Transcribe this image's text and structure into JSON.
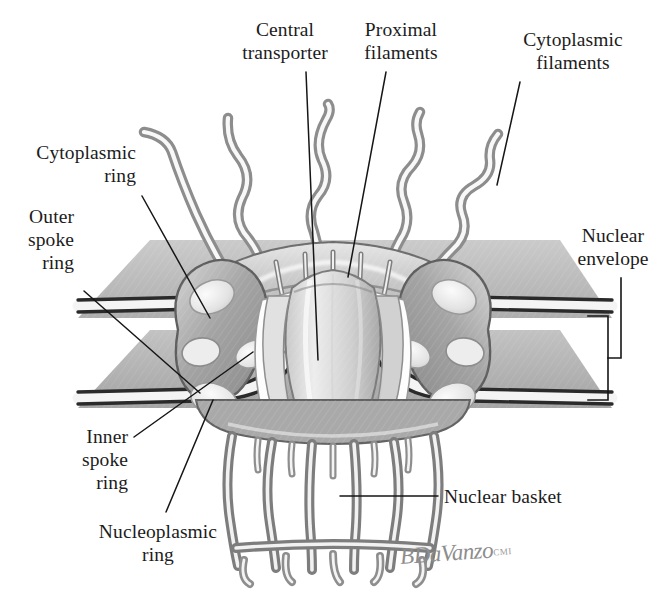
{
  "figure": {
    "kind": "scientific-illustration",
    "signature": {
      "name": "BDaVanzo",
      "credential": "CMI"
    },
    "palette": {
      "background": "#ffffff",
      "ink": "#1c1c1c",
      "membrane_dark": "#2b2b2b",
      "membrane_light": "#f2f2f2",
      "sheet_gray": "#b9b9b9",
      "sheet_gray_dark": "#9e9e9e",
      "protein_mid": "#a8a8a8",
      "protein_light": "#e8e8e8",
      "protein_highlight": "#fbfbfb",
      "filament_stroke": "#8a8a8a",
      "signature_gray": "#8d8d8d"
    }
  },
  "labels": [
    {
      "id": "central-transporter",
      "text": "Central\ntransporter",
      "x": 225,
      "y": 18,
      "w": 120,
      "align": "center",
      "leader": {
        "x1": 306,
        "y1": 72,
        "x2": 318,
        "y2": 360
      }
    },
    {
      "id": "proximal-filaments",
      "text": "Proximal\nfilaments",
      "x": 347,
      "y": 18,
      "w": 108,
      "align": "center",
      "leader": {
        "x1": 386,
        "y1": 72,
        "x2": 348,
        "y2": 277
      }
    },
    {
      "id": "cytoplasmic-filaments",
      "text": "Cytoplasmic\nfilaments",
      "x": 498,
      "y": 28,
      "w": 150,
      "align": "center",
      "leader": {
        "x1": 520,
        "y1": 82,
        "x2": 497,
        "y2": 185
      }
    },
    {
      "id": "cytoplasmic-ring",
      "text": "Cytoplasmic\nring",
      "x": 8,
      "y": 141,
      "w": 128,
      "align": "right",
      "leader": {
        "x1": 142,
        "y1": 196,
        "x2": 210,
        "y2": 318
      }
    },
    {
      "id": "outer-spoke-ring",
      "text": "Outer\nspoke\nring",
      "x": 8,
      "y": 205,
      "w": 66,
      "align": "right",
      "leader": {
        "x1": 84,
        "y1": 291,
        "x2": 200,
        "y2": 393
      }
    },
    {
      "id": "inner-spoke-ring",
      "text": "Inner\nspoke\nring",
      "x": 62,
      "y": 425,
      "w": 66,
      "align": "right",
      "leader": {
        "x1": 134,
        "y1": 437,
        "x2": 253,
        "y2": 352
      }
    },
    {
      "id": "nucleoplasmic-ring",
      "text": "Nucleoplasmic\nring",
      "x": 84,
      "y": 520,
      "w": 148,
      "align": "center",
      "leader": {
        "x1": 166,
        "y1": 512,
        "x2": 213,
        "y2": 400
      }
    },
    {
      "id": "nuclear-basket",
      "text": "Nuclear basket",
      "x": 444,
      "y": 485,
      "w": 160,
      "align": "left",
      "leader": {
        "x1": 438,
        "y1": 496,
        "x2": 340,
        "y2": 496
      }
    },
    {
      "id": "nuclear-envelope",
      "text": "Nuclear\nenvelope",
      "x": 563,
      "y": 224,
      "w": 100,
      "align": "center",
      "leader": null
    }
  ],
  "bracket": {
    "id": "nuclear-envelope-bracket",
    "stem_x": 621,
    "stem_top": 278,
    "stem_bottom": 357,
    "spine_x": 608,
    "top_y": 316,
    "bottom_y": 400,
    "tick_x": 588
  },
  "structure": {
    "membranes": [
      {
        "id": "outer-membrane-left",
        "side": "left",
        "layer": "outer"
      },
      {
        "id": "outer-membrane-right",
        "side": "right",
        "layer": "outer"
      },
      {
        "id": "inner-membrane-left",
        "side": "left",
        "layer": "inner"
      },
      {
        "id": "inner-membrane-right",
        "side": "right",
        "layer": "inner"
      }
    ],
    "cytoplasmic_filament_count": 5,
    "nuclear_basket_filament_count": 6,
    "proximal_filament_count": 5
  }
}
